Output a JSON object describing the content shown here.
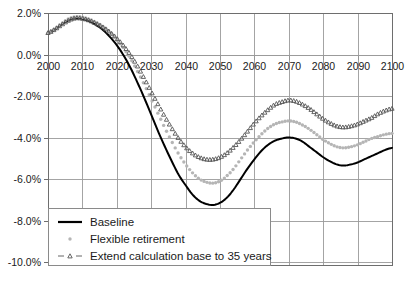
{
  "chart_data": {
    "type": "line",
    "title": "",
    "subtitle": "",
    "xlabel": "",
    "ylabel": "",
    "xlim": [
      2000,
      2100
    ],
    "ylim": [
      -10.0,
      2.0
    ],
    "grid": true,
    "legend_position": "bottom-left",
    "x_ticks": [
      "2000",
      "2010",
      "2020",
      "2030",
      "2040",
      "2050",
      "2060",
      "2070",
      "2080",
      "2090",
      "2100"
    ],
    "x_tick_values": [
      2000,
      2010,
      2020,
      2030,
      2040,
      2050,
      2060,
      2070,
      2080,
      2090,
      2100
    ],
    "y_ticks": [
      "2.0%",
      "0.0%",
      "-2.0%",
      "-4.0%",
      "-6.0%",
      "-8.0%",
      "-10.0%"
    ],
    "y_tick_values": [
      2.0,
      0.0,
      -2.0,
      -4.0,
      -6.0,
      -8.0,
      -10.0
    ],
    "x": [
      2000,
      2002,
      2004,
      2006,
      2008,
      2010,
      2012,
      2014,
      2016,
      2018,
      2020,
      2022,
      2024,
      2026,
      2028,
      2030,
      2032,
      2034,
      2036,
      2038,
      2040,
      2042,
      2044,
      2046,
      2048,
      2050,
      2052,
      2054,
      2056,
      2058,
      2060,
      2062,
      2064,
      2066,
      2068,
      2070,
      2072,
      2074,
      2076,
      2078,
      2080,
      2082,
      2084,
      2086,
      2088,
      2090,
      2092,
      2094,
      2096,
      2098,
      2100
    ],
    "series": [
      {
        "name": "Baseline",
        "color": "#000000",
        "marker": "none",
        "style": "solid",
        "values": [
          1.05,
          1.2,
          1.45,
          1.65,
          1.75,
          1.72,
          1.6,
          1.42,
          1.18,
          0.85,
          0.45,
          -0.05,
          -0.65,
          -1.35,
          -2.1,
          -2.9,
          -3.7,
          -4.45,
          -5.15,
          -5.8,
          -6.3,
          -6.75,
          -7.05,
          -7.2,
          -7.25,
          -7.15,
          -6.9,
          -6.5,
          -6.0,
          -5.5,
          -5.05,
          -4.65,
          -4.35,
          -4.15,
          -4.05,
          -4.0,
          -4.05,
          -4.2,
          -4.45,
          -4.7,
          -4.95,
          -5.15,
          -5.3,
          -5.35,
          -5.3,
          -5.2,
          -5.05,
          -4.9,
          -4.75,
          -4.6,
          -4.5
        ]
      },
      {
        "name": "Flexible retirement",
        "color": "#b5b5b5",
        "marker": "dot",
        "style": "dotted",
        "values": [
          1.05,
          1.25,
          1.5,
          1.72,
          1.82,
          1.8,
          1.7,
          1.55,
          1.35,
          1.08,
          0.72,
          0.3,
          -0.2,
          -0.8,
          -1.45,
          -2.15,
          -2.85,
          -3.55,
          -4.2,
          -4.8,
          -5.3,
          -5.7,
          -6.0,
          -6.15,
          -6.2,
          -6.1,
          -5.85,
          -5.5,
          -5.05,
          -4.6,
          -4.2,
          -3.85,
          -3.55,
          -3.35,
          -3.25,
          -3.2,
          -3.25,
          -3.4,
          -3.6,
          -3.85,
          -4.1,
          -4.3,
          -4.45,
          -4.5,
          -4.45,
          -4.35,
          -4.2,
          -4.05,
          -3.95,
          -3.85,
          -3.8
        ]
      },
      {
        "name": "Extend calculation base to 35 years",
        "color": "#555555",
        "marker": "triangle",
        "style": "dotted",
        "values": [
          1.05,
          1.22,
          1.45,
          1.65,
          1.76,
          1.74,
          1.65,
          1.5,
          1.32,
          1.08,
          0.78,
          0.42,
          -0.02,
          -0.55,
          -1.15,
          -1.78,
          -2.4,
          -3.0,
          -3.55,
          -4.05,
          -4.45,
          -4.75,
          -4.95,
          -5.05,
          -5.05,
          -4.95,
          -4.75,
          -4.45,
          -4.1,
          -3.7,
          -3.3,
          -2.95,
          -2.65,
          -2.4,
          -2.28,
          -2.2,
          -2.25,
          -2.4,
          -2.6,
          -2.85,
          -3.1,
          -3.3,
          -3.45,
          -3.5,
          -3.45,
          -3.35,
          -3.2,
          -3.05,
          -2.85,
          -2.7,
          -2.6
        ]
      }
    ]
  },
  "legend": {
    "items": [
      {
        "label": "Baseline"
      },
      {
        "label": "Flexible retirement"
      },
      {
        "label": "Extend calculation base to 35 years"
      }
    ]
  }
}
